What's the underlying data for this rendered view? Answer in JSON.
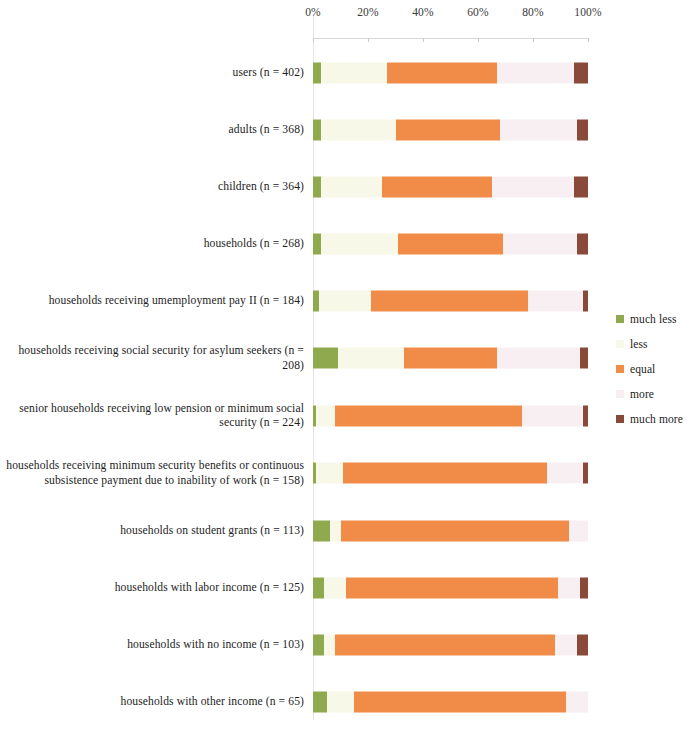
{
  "chart_data": {
    "type": "bar",
    "subtype": "stacked-horizontal-100-percent",
    "title": "",
    "xlabel": "",
    "ylabel": "",
    "xlim": [
      0,
      100
    ],
    "xticks": [
      0,
      20,
      40,
      60,
      80,
      100
    ],
    "xtick_labels": [
      "0%",
      "20%",
      "40%",
      "60%",
      "80%",
      "100%"
    ],
    "grid": false,
    "legend_position": "right",
    "series": [
      {
        "name": "much less",
        "color": "#8faa4e"
      },
      {
        "name": "less",
        "color": "#f7f8e8"
      },
      {
        "name": "equal",
        "color": "#f08c47"
      },
      {
        "name": "more",
        "color": "#f7eff2"
      },
      {
        "name": "much more",
        "color": "#8a4a3a"
      }
    ],
    "categories": [
      "users (n = 402)",
      "adults (n = 368)",
      "children (n = 364)",
      "households (n = 268)",
      "households receiving umemployment pay II (n = 184)",
      "households receiving social security for asylum seekers (n = 208)",
      "senior households receiving low pension or minimum social security (n = 224)",
      "households receiving minimum security benefits or continuous subsistence payment due to inability of work (n = 158)",
      "households on student grants (n = 113)",
      "households with labor income (n = 125)",
      "households with no income (n = 103)",
      "households with other income (n = 65)"
    ],
    "values": [
      [
        3,
        24,
        40,
        28,
        5
      ],
      [
        3,
        27,
        38,
        28,
        4
      ],
      [
        3,
        22,
        40,
        30,
        5
      ],
      [
        3,
        28,
        38,
        27,
        4
      ],
      [
        2,
        19,
        57,
        20,
        2
      ],
      [
        9,
        24,
        34,
        30,
        3
      ],
      [
        1,
        7,
        68,
        22,
        2
      ],
      [
        1,
        10,
        74,
        13,
        2
      ],
      [
        6,
        4,
        83,
        7,
        0
      ],
      [
        4,
        8,
        77,
        8,
        3
      ],
      [
        4,
        4,
        80,
        8,
        4
      ],
      [
        5,
        10,
        77,
        8,
        0
      ]
    ]
  },
  "axis": {
    "ticks": [
      {
        "label": "0%",
        "pos": 0
      },
      {
        "label": "20%",
        "pos": 20
      },
      {
        "label": "40%",
        "pos": 40
      },
      {
        "label": "60%",
        "pos": 60
      },
      {
        "label": "80%",
        "pos": 80
      },
      {
        "label": "100%",
        "pos": 100
      }
    ]
  },
  "legend": {
    "items": [
      {
        "label": "much less",
        "color": "#8faa4e"
      },
      {
        "label": "less",
        "color": "#f7f8e8"
      },
      {
        "label": "equal",
        "color": "#f08c47"
      },
      {
        "label": "more",
        "color": "#f7eff2"
      },
      {
        "label": "much more",
        "color": "#8a4a3a"
      }
    ]
  }
}
